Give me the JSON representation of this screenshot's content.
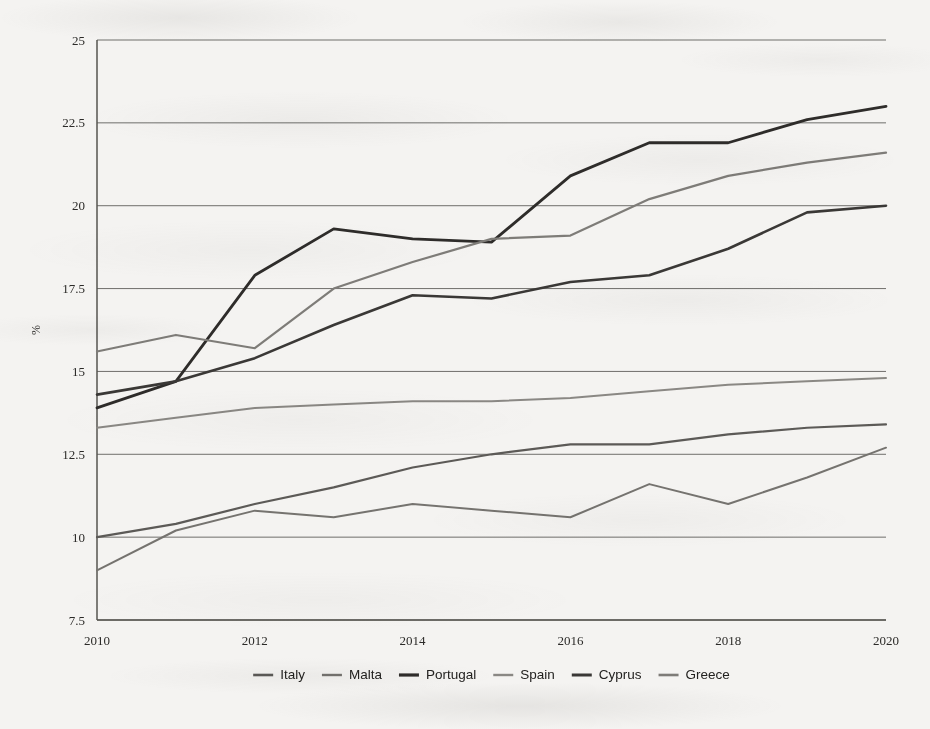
{
  "chart_data": {
    "type": "line",
    "title": "",
    "subtitle": "",
    "xlabel": "",
    "ylabel": "%",
    "x": [
      2010,
      2011,
      2012,
      2013,
      2014,
      2015,
      2016,
      2017,
      2018,
      2019,
      2020
    ],
    "xtick_labels": [
      "2010",
      "2012",
      "2014",
      "2016",
      "2018",
      "2020"
    ],
    "xtick_values": [
      2010,
      2012,
      2014,
      2016,
      2018,
      2020
    ],
    "ytick_labels": [
      "7.5",
      "10",
      "12.5",
      "15",
      "17.5",
      "20",
      "22.5",
      "25"
    ],
    "ytick_values": [
      7.5,
      10,
      12.5,
      15,
      17.5,
      20,
      22.5,
      25
    ],
    "xlim": [
      2010,
      2020
    ],
    "ylim": [
      7.5,
      25
    ],
    "grid": true,
    "legend_position": "bottom",
    "series": [
      {
        "name": "Italy",
        "color": "#5c5a57",
        "width": 2.2,
        "values": [
          10.0,
          10.4,
          11.0,
          11.5,
          12.1,
          12.5,
          12.8,
          12.8,
          13.1,
          13.3,
          13.4
        ]
      },
      {
        "name": "Malta",
        "color": "#75736f",
        "width": 2.0,
        "values": [
          9.0,
          10.2,
          10.8,
          10.6,
          11.0,
          10.8,
          10.6,
          11.6,
          11.0,
          11.8,
          12.7
        ]
      },
      {
        "name": "Portugal",
        "color": "#2e2c2a",
        "width": 2.8,
        "values": [
          13.9,
          14.7,
          17.9,
          19.3,
          19.0,
          18.9,
          20.9,
          21.9,
          21.9,
          22.6,
          23.0
        ]
      },
      {
        "name": "Spain",
        "color": "#8a8884",
        "width": 2.0,
        "values": [
          13.3,
          13.6,
          13.9,
          14.0,
          14.1,
          14.1,
          14.2,
          14.4,
          14.6,
          14.7,
          14.8
        ]
      },
      {
        "name": "Cyprus",
        "color": "#3a3836",
        "width": 2.6,
        "values": [
          14.3,
          14.7,
          15.4,
          16.4,
          17.3,
          17.2,
          17.7,
          17.9,
          18.7,
          19.8,
          20.0
        ]
      },
      {
        "name": "Greece",
        "color": "#7e7c78",
        "width": 2.2,
        "values": [
          15.6,
          16.1,
          15.7,
          17.5,
          18.3,
          19.0,
          19.1,
          20.2,
          20.9,
          21.3,
          21.6
        ]
      }
    ]
  },
  "legend": {
    "items": [
      {
        "label": "Italy"
      },
      {
        "label": "Malta"
      },
      {
        "label": "Portugal"
      },
      {
        "label": "Spain"
      },
      {
        "label": "Cyprus"
      },
      {
        "label": "Greece"
      }
    ]
  }
}
